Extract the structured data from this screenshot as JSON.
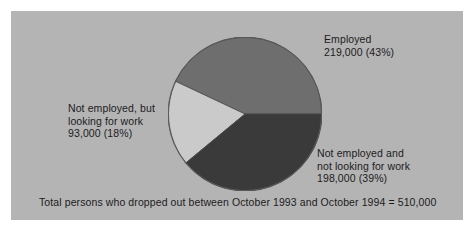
{
  "figure": {
    "background_color": "#ffffff",
    "panel_color": "#b4b4b4",
    "text_color": "#1c1c1c",
    "caption": "Total persons who dropped out between October 1993 and October 1994 = 510,000"
  },
  "labels": {
    "employed": "Employed\n219,000 (43%)",
    "looking": "Not employed, but\nlooking for work\n93,000 (18%)",
    "not_looking": "Not employed and\nnot looking for work\n198,000 (39%)"
  },
  "chart_data": {
    "type": "pie",
    "title": "",
    "subtitle": "",
    "xlabel": "",
    "ylabel": "",
    "grid": false,
    "legend": "none",
    "annotations": [
      "Total persons who dropped out between October 1993 and October 1994 = 510,000"
    ],
    "total_label": "510,000",
    "total_value": 510000,
    "start_angle_deg": 0,
    "direction": "counterclockwise",
    "center": [
      234,
      103
    ],
    "radius": 77,
    "categories": [
      "Employed",
      "Not employed, but looking for work",
      "Not employed and not looking for work"
    ],
    "values": [
      219000,
      198000,
      93000
    ],
    "percentages": [
      43,
      39,
      18
    ],
    "colors": [
      "#6e6e6e",
      "#3a3a3a",
      "#cacaca"
    ],
    "slices": [
      {
        "name": "Employed",
        "value": 219000,
        "value_label": "219,000",
        "percent": 43,
        "percent_label": "(43%)",
        "color": "#6e6e6e",
        "start_angle_deg": 0,
        "end_angle_deg": 154.8
      },
      {
        "name": "Not employed, but looking for work",
        "value": 93000,
        "value_label": "93,000",
        "percent": 18,
        "percent_label": "(18%)",
        "color": "#cacaca",
        "start_angle_deg": 154.8,
        "end_angle_deg": 219.6
      },
      {
        "name": "Not employed and not looking for work",
        "value": 198000,
        "value_label": "198,000",
        "percent": 39,
        "percent_label": "(39%)",
        "color": "#3a3a3a",
        "start_angle_deg": 219.6,
        "end_angle_deg": 360
      }
    ]
  }
}
